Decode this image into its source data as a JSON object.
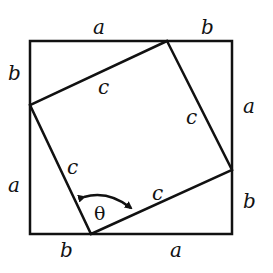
{
  "diagram": {
    "outer_square": {
      "x1": 30,
      "y1": 41,
      "x2": 232,
      "y2": 234
    },
    "inner_square": {
      "points": [
        [
          167,
          41
        ],
        [
          232,
          170
        ],
        [
          91,
          234
        ],
        [
          30,
          105
        ]
      ]
    },
    "labels": {
      "top_a": "a",
      "top_b": "b",
      "left_b": "b",
      "left_a": "a",
      "right_a": "a",
      "right_b": "b",
      "bottom_b": "b",
      "bottom_a": "a",
      "c_top": "c",
      "c_right": "c",
      "c_left": "c",
      "c_bottom": "c",
      "angle": "θ"
    },
    "colors": {
      "stroke": "#111111",
      "background": "#ffffff"
    }
  }
}
